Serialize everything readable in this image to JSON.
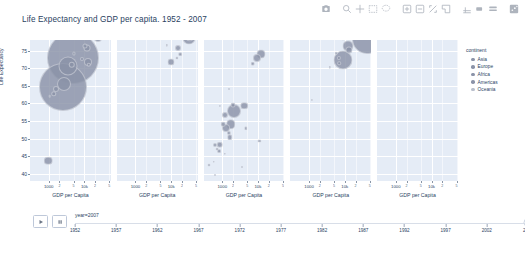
{
  "modebar": {
    "buttons": [
      {
        "name": "camera-icon",
        "label": "Download plot as a png"
      },
      {
        "name": "zoom-icon",
        "label": "Zoom"
      },
      {
        "name": "pan-icon",
        "label": "Pan"
      },
      {
        "name": "zoom-in-icon",
        "label": "Zoom in"
      },
      {
        "name": "zoom-out-icon",
        "label": "Zoom out"
      },
      {
        "name": "autoscale-icon",
        "label": "Autoscale"
      },
      {
        "name": "reset-axes-icon",
        "label": "Reset axes"
      },
      {
        "name": "box-select-icon",
        "label": "Box Select"
      },
      {
        "name": "lasso-select-icon",
        "label": "Lasso Select"
      },
      {
        "name": "spike-lines-icon",
        "label": "Toggle Spike Lines"
      },
      {
        "name": "hover-closest-icon",
        "label": "Show closest data on hover"
      },
      {
        "name": "hover-compare-icon",
        "label": "Compare data on hover"
      },
      {
        "name": "plotly-logo-icon",
        "label": "Produced with Plotly"
      }
    ]
  },
  "header": {
    "title": "Life Expectancy and GDP per capita. 1952 - 2007"
  },
  "axes": {
    "y_title": "Life Expectancy",
    "y_ticks": [
      "75",
      "70",
      "65",
      "60",
      "55",
      "50",
      "45",
      "40"
    ],
    "x_title": "GDP per Capita",
    "x_major_ticks": [
      "1000",
      "10k"
    ],
    "x_minor_ticks": [
      "2",
      "5",
      "2",
      "5"
    ]
  },
  "facets": [
    {
      "id": "asia",
      "title": "continent=Asia"
    },
    {
      "id": "europe",
      "title": "continent=Europe"
    },
    {
      "id": "africa",
      "title": "continent=Africa"
    },
    {
      "id": "americas",
      "title": "continent=Americas"
    },
    {
      "id": "oceania",
      "title": "continent=Oceania"
    }
  ],
  "legend": {
    "title": "continent",
    "items": [
      {
        "label": "Asia",
        "color": "#8b93a8"
      },
      {
        "label": "Europe",
        "color": "#8b93a8"
      },
      {
        "label": "Africa",
        "color": "#8b93a8"
      },
      {
        "label": "Americas",
        "color": "#8b93a8"
      },
      {
        "label": "Oceania",
        "color": "#b9bfcc"
      }
    ]
  },
  "controls": {
    "play_label": "Play",
    "pause_label": "Pause",
    "slider_label": "year=2007",
    "slider_value": "2007",
    "slider_ticks": [
      "1952",
      "1957",
      "1962",
      "1967",
      "1972",
      "1977",
      "1982",
      "1987",
      "1992",
      "1997",
      "2002",
      "2007"
    ]
  },
  "chart_data": {
    "type": "scatter",
    "title": "Life Expectancy and GDP per capita. 1952 - 2007",
    "xlabel": "GDP per Capita",
    "ylabel": "Life Expectancy",
    "xscale": "log",
    "xlim": [
      300,
      55000
    ],
    "ylim": [
      38,
      78
    ],
    "grid": true,
    "legend_position": "right",
    "size_encodes": "population",
    "color_encodes": "continent",
    "animation_frame": "year",
    "animation_value": 2007,
    "facet_column": "continent",
    "facets": [
      "Asia",
      "Europe",
      "Africa",
      "Americas",
      "Oceania"
    ],
    "series": [
      {
        "name": "Asia",
        "color": "#8b93a8",
        "points": [
          {
            "x": 4959,
            "y": 72.9,
            "size": 52.0
          },
          {
            "x": 2452,
            "y": 64.7,
            "size": 48.0
          },
          {
            "x": 31656,
            "y": 82.6,
            "size": 22.0
          },
          {
            "x": 3540,
            "y": 70.6,
            "size": 19.0
          },
          {
            "x": 2606,
            "y": 65.5,
            "size": 14.0
          },
          {
            "x": 12451,
            "y": 71.8,
            "size": 8.0
          },
          {
            "x": 23348,
            "y": 78.6,
            "size": 8.0
          },
          {
            "x": 11606,
            "y": 75.6,
            "size": 7.0
          },
          {
            "x": 4471,
            "y": 71.0,
            "size": 6.5
          },
          {
            "x": 1593,
            "y": 64.1,
            "size": 6.0
          },
          {
            "x": 1391,
            "y": 62.7,
            "size": 5.5
          },
          {
            "x": 10461,
            "y": 76.4,
            "size": 5.0
          },
          {
            "x": 13206,
            "y": 71.0,
            "size": 4.5
          },
          {
            "x": 28718,
            "y": 80.7,
            "size": 4.2
          },
          {
            "x": 8458,
            "y": 72.5,
            "size": 4.0
          },
          {
            "x": 39725,
            "y": 82.0,
            "size": 3.6
          },
          {
            "x": 5186,
            "y": 74.2,
            "size": 3.2
          },
          {
            "x": 47143,
            "y": 79.9,
            "size": 2.8
          },
          {
            "x": 1057,
            "y": 62.1,
            "size": 2.6
          },
          {
            "x": 974,
            "y": 43.8,
            "size": 8.5
          }
        ]
      },
      {
        "name": "Europe",
        "color": "#8b93a8",
        "points": [
          {
            "x": 32170,
            "y": 78.7,
            "size": 13.0
          },
          {
            "x": 33203,
            "y": 79.4,
            "size": 11.5
          },
          {
            "x": 28569,
            "y": 80.5,
            "size": 10.0
          },
          {
            "x": 30470,
            "y": 79.4,
            "size": 9.5
          },
          {
            "x": 21654,
            "y": 79.0,
            "size": 8.0
          },
          {
            "x": 9786,
            "y": 71.8,
            "size": 7.0
          },
          {
            "x": 15389,
            "y": 75.6,
            "size": 6.0
          },
          {
            "x": 36126,
            "y": 80.2,
            "size": 5.0
          },
          {
            "x": 35278,
            "y": 80.5,
            "size": 4.5
          },
          {
            "x": 25768,
            "y": 78.9,
            "size": 4.0
          },
          {
            "x": 18009,
            "y": 74.0,
            "size": 3.6
          },
          {
            "x": 14619,
            "y": 73.0,
            "size": 3.2
          },
          {
            "x": 33860,
            "y": 80.9,
            "size": 3.0
          },
          {
            "x": 49357,
            "y": 79.4,
            "size": 2.6
          },
          {
            "x": 7446,
            "y": 76.5,
            "size": 2.4
          }
        ]
      },
      {
        "name": "Africa",
        "color": "#8b93a8",
        "points": [
          {
            "x": 12057,
            "y": 73.9,
            "size": 9.0
          },
          {
            "x": 9270,
            "y": 72.8,
            "size": 8.0
          },
          {
            "x": 7093,
            "y": 71.2,
            "size": 4.5
          },
          {
            "x": 2082,
            "y": 58.0,
            "size": 14.0
          },
          {
            "x": 1704,
            "y": 54.1,
            "size": 9.5
          },
          {
            "x": 1271,
            "y": 52.9,
            "size": 8.0
          },
          {
            "x": 4184,
            "y": 59.4,
            "size": 7.5
          },
          {
            "x": 863,
            "y": 48.3,
            "size": 6.5
          },
          {
            "x": 1217,
            "y": 56.7,
            "size": 6.0
          },
          {
            "x": 1598,
            "y": 50.4,
            "size": 5.5
          },
          {
            "x": 2013,
            "y": 59.5,
            "size": 5.0
          },
          {
            "x": 1044,
            "y": 54.1,
            "size": 4.6
          },
          {
            "x": 1569,
            "y": 51.6,
            "size": 4.2
          },
          {
            "x": 641,
            "y": 48.2,
            "size": 4.0
          },
          {
            "x": 823,
            "y": 46.5,
            "size": 3.8
          },
          {
            "x": 4513,
            "y": 52.9,
            "size": 3.4
          },
          {
            "x": 10956,
            "y": 49.3,
            "size": 3.2
          },
          {
            "x": 430,
            "y": 42.6,
            "size": 3.0
          },
          {
            "x": 706,
            "y": 47.0,
            "size": 2.8
          },
          {
            "x": 579,
            "y": 43.5,
            "size": 2.6
          },
          {
            "x": 1201,
            "y": 45.7,
            "size": 2.4
          },
          {
            "x": 863,
            "y": 59.4,
            "size": 2.2
          },
          {
            "x": 1544,
            "y": 64.2,
            "size": 2.0
          },
          {
            "x": 619,
            "y": 39.6,
            "size": 2.0
          },
          {
            "x": 3632,
            "y": 42.1,
            "size": 1.8
          }
        ]
      },
      {
        "name": "Americas",
        "color": "#8b93a8",
        "points": [
          {
            "x": 42952,
            "y": 78.2,
            "size": 30.0
          },
          {
            "x": 9066,
            "y": 72.4,
            "size": 19.0
          },
          {
            "x": 11978,
            "y": 76.2,
            "size": 11.0
          },
          {
            "x": 36319,
            "y": 80.7,
            "size": 8.5
          },
          {
            "x": 12779,
            "y": 75.3,
            "size": 7.0
          },
          {
            "x": 13171,
            "y": 78.6,
            "size": 5.0
          },
          {
            "x": 7007,
            "y": 72.9,
            "size": 4.2
          },
          {
            "x": 6873,
            "y": 71.4,
            "size": 3.6
          },
          {
            "x": 8948,
            "y": 78.3,
            "size": 3.0
          },
          {
            "x": 5728,
            "y": 74.2,
            "size": 2.6
          },
          {
            "x": 3822,
            "y": 70.2,
            "size": 2.4
          },
          {
            "x": 1201,
            "y": 60.9,
            "size": 2.2
          }
        ]
      },
      {
        "name": "Oceania",
        "color": "#b9bfcc",
        "points": [
          {
            "x": 34435,
            "y": 81.2,
            "size": 5.0
          },
          {
            "x": 25185,
            "y": 80.2,
            "size": 2.6
          }
        ]
      }
    ]
  }
}
